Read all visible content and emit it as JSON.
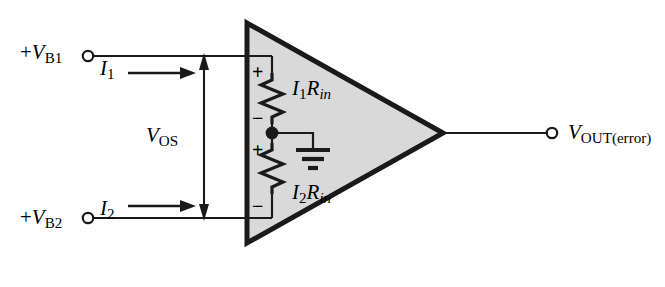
{
  "figure": {
    "background_color": "#ffffff",
    "line_color": "#1a1a1a",
    "amplifier_fill": "#d9d9d9"
  },
  "terminals": {
    "input_top": {
      "label_prefix": "+",
      "label_var": "V",
      "label_sub": "B1",
      "full_text": "+VB1"
    },
    "input_bottom": {
      "label_prefix": "+",
      "label_var": "V",
      "label_sub": "B2",
      "full_text": "+VB2"
    },
    "output": {
      "label_var": "V",
      "label_sub": "OUT(error)",
      "full_text": "VOUT(error)"
    }
  },
  "currents": {
    "top": {
      "var": "I",
      "sub": "1",
      "full_text": "I1",
      "direction": "right"
    },
    "bottom": {
      "var": "I",
      "sub": "2",
      "full_text": "I2",
      "direction": "right"
    }
  },
  "offset_voltage": {
    "var": "V",
    "sub": "OS",
    "full_text": "VOS",
    "arrow_style": "double-headed-vertical"
  },
  "resistors": {
    "top": {
      "label_current": "I",
      "label_current_sub": "1",
      "label_res": "R",
      "label_res_sub": "in",
      "full_text": "I1Rin",
      "polarity_top": "+",
      "polarity_bottom": "−"
    },
    "bottom": {
      "label_current": "I",
      "label_current_sub": "2",
      "label_res": "R",
      "label_res_sub": "in",
      "full_text": "I2Rin",
      "polarity_top": "+",
      "polarity_bottom": "−"
    }
  },
  "ground": {
    "symbol": "earth-ground",
    "bars": 3
  }
}
